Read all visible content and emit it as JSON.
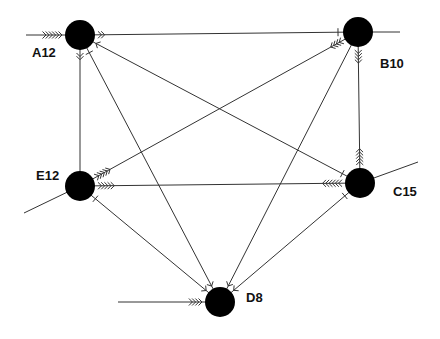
{
  "colors": {
    "node": "#000000",
    "edge": "#333333",
    "background": "#ffffff"
  },
  "nodes": [
    {
      "id": "A12",
      "label": "A12"
    },
    {
      "id": "B10",
      "label": "B10"
    },
    {
      "id": "E12",
      "label": "E12"
    },
    {
      "id": "C15",
      "label": "C15"
    },
    {
      "id": "D8",
      "label": "D8"
    }
  ],
  "edges": [
    {
      "from": "A12",
      "to": "B10",
      "marks": [
        {
          "at": "A12",
          "type": "chevron",
          "count": 2,
          "direction": "toward-B10"
        },
        {
          "at": "B10",
          "type": "tick"
        }
      ]
    },
    {
      "from": "A12",
      "to": "E12",
      "marks": [
        {
          "at": "A12",
          "type": "chevron",
          "count": 2,
          "direction": "toward-E12"
        }
      ]
    },
    {
      "from": "A12",
      "to": "C15",
      "marks": [
        {
          "at": "A12",
          "type": "chevron",
          "count": 1,
          "direction": "toward-A12"
        },
        {
          "at": "C15",
          "type": "tick"
        }
      ]
    },
    {
      "from": "A12",
      "to": "D8",
      "marks": [
        {
          "at": "A12",
          "type": "tick"
        },
        {
          "at": "D8",
          "type": "chevron",
          "count": 1,
          "direction": "toward-D8"
        }
      ]
    },
    {
      "from": "B10",
      "to": "E12",
      "marks": [
        {
          "at": "B10",
          "type": "chevron",
          "count": 4,
          "direction": "toward-E12"
        },
        {
          "at": "E12",
          "type": "chevron",
          "count": 5,
          "direction": "toward-B10"
        }
      ]
    },
    {
      "from": "B10",
      "to": "C15",
      "marks": [
        {
          "at": "B10",
          "type": "chevron",
          "count": 4,
          "direction": "toward-C15"
        },
        {
          "at": "C15",
          "type": "chevron",
          "count": 5,
          "direction": "toward-B10"
        }
      ]
    },
    {
      "from": "B10",
      "to": "D8",
      "marks": [
        {
          "at": "D8",
          "type": "chevron",
          "count": 1,
          "direction": "toward-D8"
        }
      ]
    },
    {
      "from": "E12",
      "to": "C15",
      "marks": [
        {
          "at": "E12",
          "type": "chevron",
          "count": 5,
          "direction": "toward-C15"
        },
        {
          "at": "C15",
          "type": "chevron",
          "count": 6,
          "direction": "toward-E12"
        }
      ]
    },
    {
      "from": "E12",
      "to": "D8",
      "marks": [
        {
          "at": "E12",
          "type": "tick"
        },
        {
          "at": "D8",
          "type": "chevron",
          "count": 1,
          "direction": "toward-D8"
        }
      ]
    },
    {
      "from": "C15",
      "to": "D8",
      "marks": [
        {
          "at": "C15",
          "type": "tick"
        },
        {
          "at": "D8",
          "type": "chevron",
          "count": 1,
          "direction": "toward-D8"
        }
      ]
    }
  ],
  "stubs": [
    {
      "node": "A12",
      "side": "left",
      "marks": {
        "type": "chevron",
        "count": 6,
        "direction": "toward-A12"
      }
    },
    {
      "node": "B10",
      "side": "right"
    },
    {
      "node": "E12",
      "side": "lower-left"
    },
    {
      "node": "C15",
      "side": "upper-right"
    },
    {
      "node": "D8",
      "side": "left",
      "marks": {
        "type": "chevron",
        "count": 4,
        "direction": "toward-D8"
      }
    }
  ]
}
